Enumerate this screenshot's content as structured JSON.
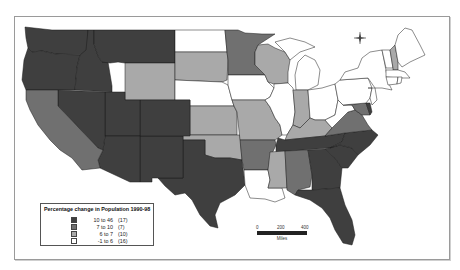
{
  "map": {
    "title": "Percentage change in Population 1990-98",
    "region": "Contiguous United States",
    "colors": {
      "class1": "#3f3f3f",
      "class2": "#707070",
      "class3": "#a9a9a9",
      "class4": "#ffffff",
      "border": "#1a1a1a"
    }
  },
  "legend": {
    "title": "Percentage change in Population 1990-98",
    "items": [
      {
        "range": "10 to 46",
        "count": "(17)",
        "color": "#3f3f3f"
      },
      {
        "range": "7 to 10",
        "count": "(7)",
        "color": "#707070"
      },
      {
        "range": "6 to  7",
        "count": "(10)",
        "color": "#a9a9a9"
      },
      {
        "range": "-1 to  6",
        "count": "(16)",
        "color": "#ffffff"
      }
    ]
  },
  "scale_bar": {
    "ticks": [
      "0",
      "200",
      "400"
    ],
    "unit": "Miles"
  },
  "compass": {
    "n": "N",
    "s": "S",
    "e": "E",
    "w": "W"
  }
}
